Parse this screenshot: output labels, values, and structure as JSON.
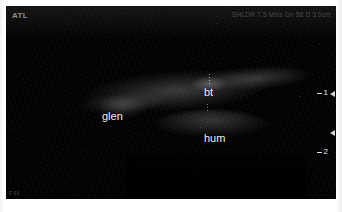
{
  "viewer": {
    "modality": "ultrasound-b-mode",
    "vendor_logo": "ATL",
    "scan_params": "SHLDR 7.5 MHz  Gn 58  D 3.0cm",
    "frame_id": "F 01"
  },
  "annotations": [
    {
      "id": "glen",
      "label": "glen",
      "meaning": "glenoid"
    },
    {
      "id": "bt",
      "label": "bt",
      "meaning": "biceps tendon"
    },
    {
      "id": "hum",
      "label": "hum",
      "meaning": "humerus"
    }
  ],
  "depth_scale": {
    "unit": "cm",
    "ticks": [
      {
        "label": "1"
      },
      {
        "label": "2"
      }
    ]
  },
  "focal_markers": [
    {
      "id": "focal-upper"
    },
    {
      "id": "focal-lower"
    }
  ],
  "colors": {
    "background": "#ffffff",
    "image_field": "#000000",
    "annotation_text": "#f2f2f2",
    "vendor_text": "#8e8e8e",
    "scale_text": "#e8e8e8"
  }
}
